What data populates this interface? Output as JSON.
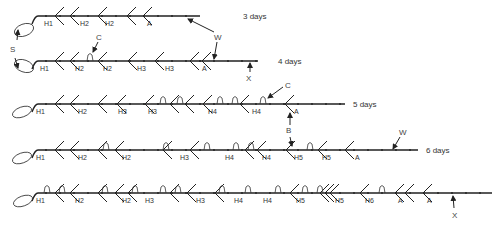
{
  "figure": {
    "rows": [
      {
        "id": "r3",
        "day_label": "3 days",
        "y": 16,
        "x_start": 38,
        "x_end": 200,
        "day_x": 243,
        "h_labels": [
          {
            "t": "H1",
            "x": 44
          },
          {
            "t": "H2",
            "x": 80
          },
          {
            "t": "H2",
            "x": 105
          },
          {
            "t": "A",
            "x": 147
          }
        ],
        "branches": [
          55,
          70,
          98,
          127,
          143
        ],
        "flowers": []
      },
      {
        "id": "r4",
        "day_label": "4 days",
        "y": 61,
        "x_start": 38,
        "x_end": 258,
        "day_x": 278,
        "h_labels": [
          {
            "t": "H1",
            "x": 40
          },
          {
            "t": "H2",
            "x": 75
          },
          {
            "t": "H2",
            "x": 103
          },
          {
            "t": "H3",
            "x": 137
          },
          {
            "t": "H3",
            "x": 165
          },
          {
            "t": "A",
            "x": 202
          }
        ],
        "branches": [
          55,
          70,
          98,
          128,
          155,
          190,
          202
        ],
        "flowers": [
          90
        ]
      },
      {
        "id": "r5",
        "day_label": "5 days",
        "y": 104,
        "x_start": 38,
        "x_end": 345,
        "day_x": 353,
        "h_labels": [
          {
            "t": "H1",
            "x": 36
          },
          {
            "t": "H2",
            "x": 78
          },
          {
            "t": "H3",
            "x": 118
          },
          {
            "t": "H3",
            "x": 148
          },
          {
            "t": "H4",
            "x": 208
          },
          {
            "t": "H4",
            "x": 252
          },
          {
            "t": "A",
            "x": 294
          }
        ],
        "branches": [
          55,
          70,
          98,
          117,
          145,
          170,
          185,
          203,
          240,
          285
        ],
        "flowers": [
          163,
          180,
          220,
          235,
          263
        ]
      },
      {
        "id": "r6",
        "day_label": "6 days",
        "y": 150,
        "x_start": 38,
        "x_end": 418,
        "day_x": 426,
        "h_labels": [
          {
            "t": "H1",
            "x": 36
          },
          {
            "t": "H2",
            "x": 78
          },
          {
            "t": "H2",
            "x": 122
          },
          {
            "t": "H3",
            "x": 180
          },
          {
            "t": "H4",
            "x": 225
          },
          {
            "t": "H4",
            "x": 262
          },
          {
            "t": "H5",
            "x": 294
          },
          {
            "t": "H5",
            "x": 322
          },
          {
            "t": "A",
            "x": 355
          }
        ],
        "branches": [
          55,
          70,
          98,
          115,
          163,
          190,
          245,
          257,
          286,
          318,
          345
        ],
        "flowers": [
          106,
          166,
          207,
          236,
          251,
          310
        ]
      },
      {
        "id": "r7",
        "day_label": "",
        "y": 193,
        "x_start": 38,
        "x_end": 492,
        "day_x": 0,
        "h_labels": [
          {
            "t": "H1",
            "x": 36
          },
          {
            "t": "H2",
            "x": 75
          },
          {
            "t": "H2",
            "x": 122
          },
          {
            "t": "H3",
            "x": 145
          },
          {
            "t": "H3",
            "x": 196
          },
          {
            "t": "H4",
            "x": 234
          },
          {
            "t": "H4",
            "x": 263
          },
          {
            "t": "H5",
            "x": 296
          },
          {
            "t": "H5",
            "x": 335
          },
          {
            "t": "H6",
            "x": 365
          },
          {
            "t": "A",
            "x": 398
          },
          {
            "t": "A",
            "x": 427
          }
        ],
        "branches": [
          55,
          70,
          98,
          115,
          128,
          170,
          187,
          215,
          290,
          320,
          325,
          330,
          360,
          395,
          405,
          423
        ],
        "flowers": [
          47,
          62,
          105,
          135,
          163,
          178,
          222,
          248,
          278,
          305,
          320,
          382
        ]
      }
    ],
    "annotations": {
      "S": {
        "label": "S",
        "x": 10,
        "y": 50
      },
      "C1": {
        "label": "C",
        "x": 96,
        "y": 37
      },
      "W1": {
        "label": "W",
        "x": 215,
        "y": 38
      },
      "X1": {
        "label": "X",
        "x": 247,
        "y": 80
      },
      "C2": {
        "label": "C",
        "x": 285,
        "y": 88
      },
      "B": {
        "label": "B",
        "x": 288,
        "y": 132
      },
      "W2": {
        "label": "W",
        "x": 399,
        "y": 133
      },
      "X2": {
        "label": "X",
        "x": 456,
        "y": 216
      }
    }
  }
}
